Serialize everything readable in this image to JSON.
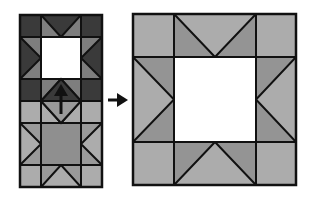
{
  "diagram": {
    "colors": {
      "outline": "#111111",
      "dark_block": "#3a3a3a",
      "dark_triangle": "#7e7e7e",
      "medium_gray": "#8c8c8c",
      "light_gray": "#acacac",
      "center_white": "#ffffff",
      "center_gray": "#8f8f8f",
      "arrow": "#111111"
    },
    "left_strip": {
      "blocks": [
        {
          "name": "top-star-block",
          "tone": "dark",
          "center": "white"
        },
        {
          "name": "bottom-star-block",
          "tone": "light",
          "center": "gray"
        }
      ],
      "has_up_arrow": true
    },
    "right_block": {
      "name": "enlarged-star-block",
      "tone": "light",
      "center": "white"
    },
    "connector_arrow": "right"
  }
}
